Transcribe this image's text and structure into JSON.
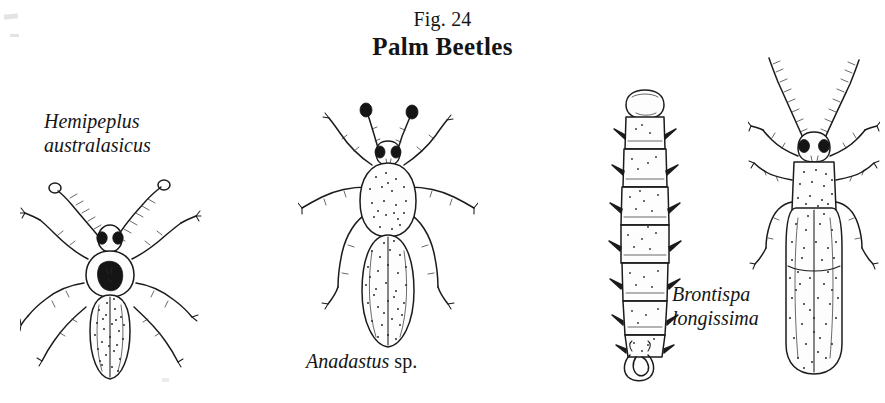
{
  "figure": {
    "number": "Fig. 24",
    "title": "Palm Beetles"
  },
  "specimens": [
    {
      "id": "hemipeplus",
      "genus": "Hemipeplus",
      "species": "australasicus",
      "rank": "",
      "label_lines": [
        "Hemipeplus",
        "australasicus"
      ],
      "view": "dorsal adult beetle"
    },
    {
      "id": "anadastus",
      "genus": "Anadastus",
      "species": "",
      "rank": "sp.",
      "label_lines": [
        "Anadastus sp."
      ],
      "view": "dorsal adult beetle"
    },
    {
      "id": "brontispa",
      "genus": "Brontispa",
      "species": "longissima",
      "rank": "",
      "label_lines": [
        "Brontispa",
        "longissima"
      ],
      "view": "larva and dorsal adult beetle"
    }
  ],
  "labels": {
    "hemipeplus_line1": "Hemipeplus",
    "hemipeplus_line2": "australasicus",
    "anadastus_genus": "Anadastus",
    "anadastus_rank": "sp.",
    "brontispa_line1": "Brontispa",
    "brontispa_line2": "longissima"
  },
  "colors": {
    "background": "#ffffff",
    "ink": "#1b1b1b",
    "text": "#151515"
  }
}
